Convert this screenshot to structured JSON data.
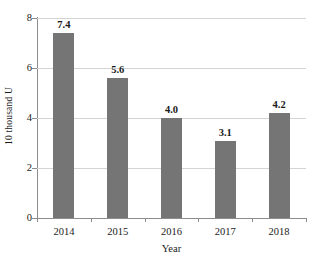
{
  "chart_data": {
    "type": "bar",
    "title": "",
    "subtitle": "",
    "categories": [
      "2014",
      "2015",
      "2016",
      "2017",
      "2018"
    ],
    "values": [
      7.4,
      5.6,
      4.0,
      3.1,
      4.2
    ],
    "value_labels": [
      "7.4",
      "5.6",
      "4.0",
      "3.1",
      "4.2"
    ],
    "xlabel": "Year",
    "ylabel": "10 thousand U",
    "ylim": [
      0,
      8
    ],
    "yticks": [
      0,
      2,
      4,
      6,
      8
    ],
    "ytick_labels": [
      "0",
      "2",
      "4",
      "6",
      "8"
    ],
    "grid": true,
    "legend": false,
    "legend_position": "none",
    "series": [
      {
        "name": "10 thousand U",
        "values": [
          7.4,
          5.6,
          4.0,
          3.1,
          4.2
        ]
      }
    ],
    "colors": {
      "bar_fill": "#757575",
      "gridline": "#d4d4d4",
      "axis_line": "#8d8d8d",
      "background": "#ffffff",
      "text": "#1a1a1a"
    }
  }
}
